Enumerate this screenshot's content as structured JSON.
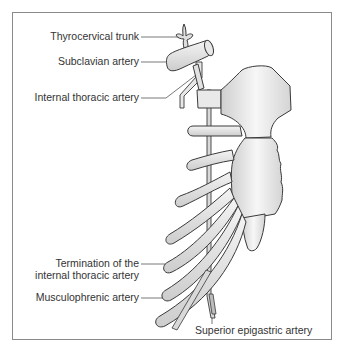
{
  "figure": {
    "labels": {
      "thyrocervical_trunk": "Thyrocervical trunk",
      "subclavian_artery": "Subclavian artery",
      "internal_thoracic_artery": "Internal thoracic artery",
      "termination_line1": "Termination of the",
      "termination_line2": "internal thoracic artery",
      "musculophrenic_artery": "Musculophrenic artery",
      "superior_epigastric_artery": "Superior epigastric artery"
    },
    "colors": {
      "outline": "#3a3a3a",
      "fill": "#e6e6e6",
      "leader": "#555555",
      "frame": "#8a8a8a"
    }
  }
}
